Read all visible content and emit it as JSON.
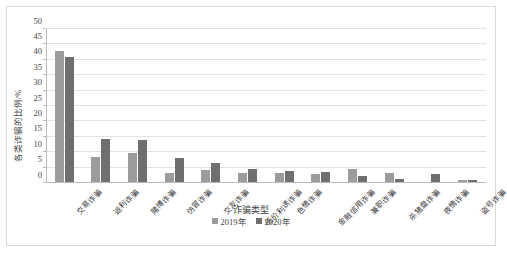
{
  "chart_data": {
    "type": "bar",
    "title": "",
    "xlabel": "诈骗类型",
    "ylabel": "各类诈骗的比例/%",
    "ylim": [
      0,
      50
    ],
    "yticks": [
      0,
      5,
      10,
      15,
      20,
      25,
      30,
      35,
      40,
      45,
      50
    ],
    "grid": true,
    "legend_position": "bottom",
    "categories": [
      "交易诈骗",
      "返利诈骗",
      "賭博诈骗",
      "仿冒诈骗",
      "交友诈骗",
      "低价利诱诈骗",
      "色情诈骗",
      "金融信用诈骗",
      "兼职诈骗",
      "杀猪盘诈骗",
      "夜情诈骗",
      "盗号诈骗"
    ],
    "series": [
      {
        "name": "2019年",
        "color": "#9c9c9c",
        "values": [
          43.0,
          8.5,
          9.9,
          3.2,
          4.1,
          3.4,
          3.2,
          3.0,
          4.7,
          3.1,
          0.0,
          1.0
        ]
      },
      {
        "name": "2020年",
        "color": "#6f6f6f",
        "values": [
          40.8,
          14.3,
          14.0,
          8.2,
          6.4,
          4.6,
          3.9,
          3.5,
          2.4,
          1.4,
          3.0,
          1.0
        ]
      }
    ]
  }
}
